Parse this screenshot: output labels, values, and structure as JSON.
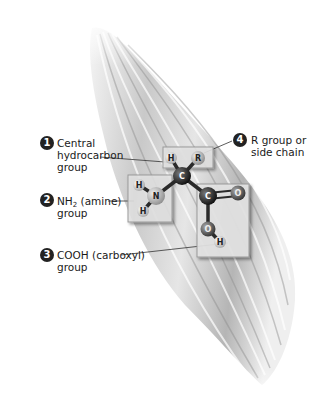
{
  "diagram": {
    "labels": [
      {
        "number": "1",
        "line1": "Central",
        "line2": "hydrocarbon",
        "line3": "group"
      },
      {
        "number": "2",
        "line1_main": "NH",
        "line1_sub": "2",
        "line1_rest": " (amine)",
        "line2": "group"
      },
      {
        "number": "3",
        "line1": "COOH (carboxyl)",
        "line2": "group"
      },
      {
        "number": "4",
        "line1": "R group or",
        "line2": "side chain"
      }
    ],
    "atoms": {
      "central_carbon": "C",
      "central_hydrogen": "H",
      "r_group": "R",
      "nitrogen": "N",
      "amine_hydrogen_1": "H",
      "amine_hydrogen_2": "H",
      "carboxyl_carbon": "C",
      "carbonyl_oxygen": "O",
      "hydroxyl_oxygen": "O",
      "hydroxyl_hydrogen": "H"
    },
    "colors": {
      "label_badge": "#222222",
      "fiber_light": "#f2f2f2",
      "fiber_dark": "#9a9a9a",
      "box_fill": "#e4e4e4",
      "carbon": "#1a1a1a",
      "nitrogen": "#b8b8b8",
      "oxygen": "#5a5a5a",
      "hydrogen": "#e8e8e8"
    }
  }
}
